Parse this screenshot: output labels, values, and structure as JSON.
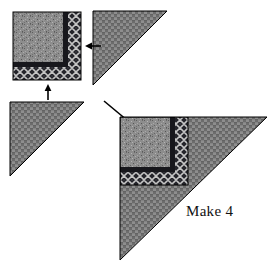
{
  "figure": {
    "kind": "quilt-block-assembly-diagram",
    "title": "",
    "background_color": "#ffffff",
    "width": 280,
    "height": 270
  },
  "annotation": {
    "make_label": "Make 4"
  },
  "fabrics": {
    "speckled_gray": {
      "name": "speckled-gray",
      "base_color": "#8d8d8d",
      "description": "mottled speckled light-gray center square"
    },
    "dark_band": {
      "name": "dark-navy-band",
      "base_color": "#1d1d22",
      "description": "narrow dark border strip"
    },
    "lattice": {
      "name": "dark-lattice-diamond",
      "base_color": "#2a2a2e",
      "accent_color": "#c9c9c9",
      "description": "dark crosshatch diamond lattice border strip"
    },
    "weave": {
      "name": "gray-basketweave",
      "base_color": "#7f7f7f",
      "accent_color": "#6a6a6a",
      "description": "medium gray woven basketweave triangles"
    }
  },
  "pieces": [
    {
      "id": "corner-square-source",
      "label": "pieced corner square",
      "shape": "square",
      "position": {
        "x": 13,
        "y": 12,
        "w": 68,
        "h": 68
      }
    },
    {
      "id": "triangle-top-right",
      "label": "basketweave half-square triangle",
      "shape": "right-triangle",
      "right_angle": "top-left",
      "position": {
        "x": 93,
        "y": 11,
        "w": 74,
        "h": 74
      }
    },
    {
      "id": "triangle-bottom-left",
      "label": "basketweave half-square triangle",
      "shape": "right-triangle",
      "right_angle": "top-left",
      "position": {
        "x": 10,
        "y": 102,
        "w": 74,
        "h": 74
      }
    },
    {
      "id": "assembled-unit",
      "label": "assembled corner unit",
      "shape": "right-triangle",
      "right_angle": "top-left",
      "position": {
        "x": 120,
        "y": 117,
        "w": 147,
        "h": 143
      }
    }
  ],
  "arrows": [
    {
      "id": "arrow-left",
      "label": "join triangle to square",
      "direction": "left",
      "x": 82,
      "y": 46
    },
    {
      "id": "arrow-up",
      "label": "join triangle to square",
      "direction": "up",
      "x": 48,
      "y": 85
    },
    {
      "id": "arrow-diagonal",
      "label": "resulting unit",
      "direction": "down-right",
      "x": 104,
      "y": 101
    }
  ]
}
